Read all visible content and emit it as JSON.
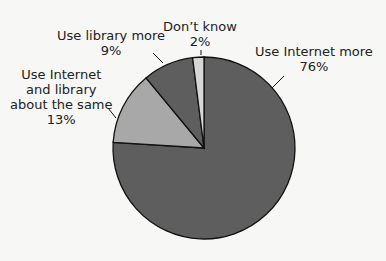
{
  "chart_data": {
    "type": "pie",
    "title": "",
    "start_angle_deg": 0,
    "direction": "clockwise",
    "slices": [
      {
        "label": "Use Internet more",
        "value": 76,
        "display": "76%",
        "color": "#5e5e5e"
      },
      {
        "label": "Use Internet and library about the same",
        "value": 13,
        "display": "13%",
        "color": "#a8a8a8"
      },
      {
        "label": "Use library more",
        "value": 9,
        "display": "9%",
        "color": "#5e5e5e"
      },
      {
        "label": "Don't know",
        "value": 2,
        "display": "2%",
        "color": "#d6d6d6"
      }
    ]
  },
  "labels": {
    "internet_more": {
      "l1": "Use Internet more",
      "l2": "76%"
    },
    "same": {
      "l1": "Use Internet",
      "l2": "and library",
      "l3": "about the same",
      "l4": "13%"
    },
    "library_more": {
      "l1": "Use library more",
      "l2": "9%"
    },
    "dont_know": {
      "l1": "Don’t know",
      "l2": "2%"
    }
  }
}
